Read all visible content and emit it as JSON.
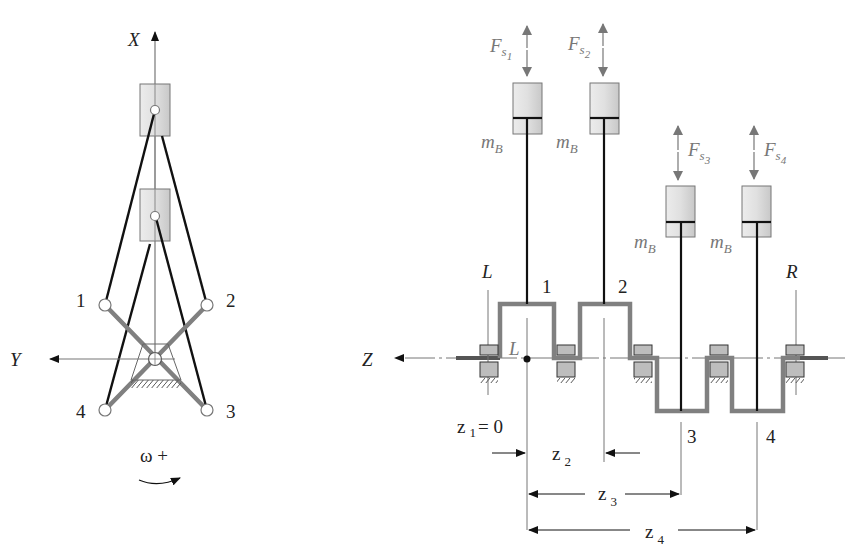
{
  "left_view": {
    "axis_x_label": "X",
    "axis_y_label": "Y",
    "crank_labels": [
      "1",
      "2",
      "3",
      "4"
    ],
    "rotation_label": "ω +"
  },
  "right_view": {
    "axis_z_label": "Z",
    "bearing_left_label": "L",
    "bearing_right_label": "R",
    "origin_label": "L",
    "force_symbol": "F",
    "force_subscript_s": "s",
    "forces": [
      {
        "index": "1"
      },
      {
        "index": "2"
      },
      {
        "index": "3"
      },
      {
        "index": "4"
      }
    ],
    "mass_symbol": "m",
    "mass_subscript": "B",
    "crank_labels": [
      "1",
      "2",
      "3",
      "4"
    ],
    "dimensions": {
      "z1_symbol": "z",
      "z1_index": "1",
      "z1_value": "= 0",
      "z2_symbol": "z",
      "z2_index": "2",
      "z3_symbol": "z",
      "z3_index": "3",
      "z4_symbol": "z",
      "z4_index": "4"
    }
  },
  "colors": {
    "crank": "#808080",
    "piston_fill": "#d9d9d9",
    "bearing_fill": "#bdbdbd",
    "rod": "#111111",
    "force_arrow": "#808080",
    "label_gray": "#777777"
  }
}
